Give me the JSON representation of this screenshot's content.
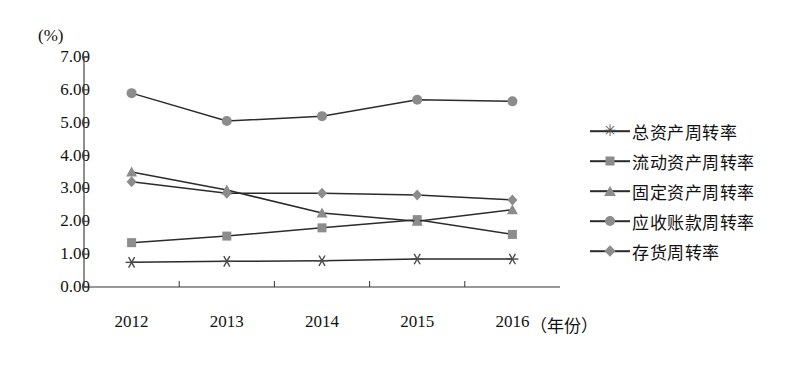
{
  "chart_data": {
    "type": "line",
    "title": "",
    "xlabel": "（年份）",
    "ylabel": "(%)",
    "categories": [
      "2012",
      "2013",
      "2014",
      "2015",
      "2016"
    ],
    "ylim": [
      0,
      7
    ],
    "ytick_labels": [
      "0.00",
      "1.00",
      "2.00",
      "3.00",
      "4.00",
      "5.00",
      "6.00",
      "7.00"
    ],
    "ytick_values": [
      0,
      1,
      2,
      3,
      4,
      5,
      6,
      7
    ],
    "grid": false,
    "legend_position": "right",
    "series": [
      {
        "name": "总资产周转率",
        "marker": "asterisk",
        "color": "#4a4a4a",
        "values": [
          0.75,
          0.78,
          0.8,
          0.85,
          0.85
        ]
      },
      {
        "name": "流动资产周转率",
        "marker": "square",
        "color": "#8c8c8c",
        "values": [
          1.35,
          1.55,
          1.8,
          2.05,
          1.6
        ]
      },
      {
        "name": "固定资产周转率",
        "marker": "triangle",
        "color": "#8c8c8c",
        "values": [
          3.5,
          2.95,
          2.25,
          2.0,
          2.35
        ]
      },
      {
        "name": "应收账款周转率",
        "marker": "circle",
        "color": "#8c8c8c",
        "values": [
          5.9,
          5.05,
          5.2,
          5.7,
          5.65
        ]
      },
      {
        "name": "存货周转率",
        "marker": "diamond",
        "color": "#8c8c8c",
        "values": [
          3.2,
          2.85,
          2.85,
          2.8,
          2.65
        ]
      }
    ]
  },
  "axis": {
    "unit_label": "(%)",
    "x_title": "（年份）"
  }
}
